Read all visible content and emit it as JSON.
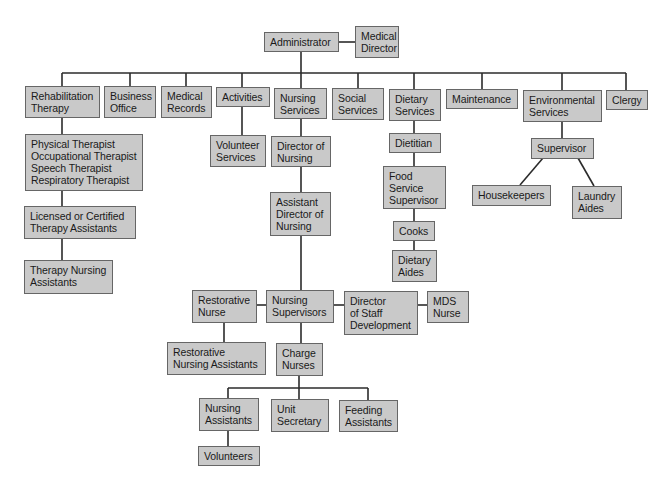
{
  "diagram": {
    "type": "org-chart",
    "colors": {
      "box_fill": "#c9c9c9",
      "box_border": "#666666",
      "line": "#2b2b2b",
      "text": "#1a1a1a",
      "background": "#ffffff"
    },
    "nodes": {
      "administrator": "Administrator",
      "medical_director": "Medical\nDirector",
      "rehabilitation_therapy": "Rehabilitation\nTherapy",
      "business_office": "Business\nOffice",
      "medical_records": "Medical\nRecords",
      "activities": "Activities",
      "nursing_services": "Nursing\nServices",
      "social_services": "Social\nServices",
      "dietary_services": "Dietary\nServices",
      "maintenance": "Maintenance",
      "environmental_services": "Environmental\nServices",
      "clergy": "Clergy",
      "therapists": "Physical Therapist\nOccupational Therapist\nSpeech Therapist\nRespiratory Therapist",
      "licensed_therapy_assistants": "Licensed or Certified\nTherapy Assistants",
      "therapy_nursing_assistants": "Therapy Nursing\nAssistants",
      "volunteer_services": "Volunteer\nServices",
      "director_of_nursing": "Director of\nNursing",
      "assistant_director_of_nursing": "Assistant\nDirector of\nNursing",
      "restorative_nurse": "Restorative\nNurse",
      "nursing_supervisors": "Nursing\nSupervisors",
      "director_staff_development": "Director\nof Staff\nDevelopment",
      "mds_nurse": "MDS\nNurse",
      "restorative_nursing_assistants": "Restorative\nNursing Assistants",
      "charge_nurses": "Charge\nNurses",
      "nursing_assistants": "Nursing\nAssistants",
      "unit_secretary": "Unit\nSecretary",
      "feeding_assistants": "Feeding\nAssistants",
      "volunteers": "Volunteers",
      "dietitian": "Dietitian",
      "food_service_supervisor": "Food\nService\nSupervisor",
      "cooks": "Cooks",
      "dietary_aides": "Dietary\nAides",
      "supervisor": "Supervisor",
      "housekeepers": "Housekeepers",
      "laundry_aides": "Laundry\nAides"
    },
    "edges": [
      [
        "administrator",
        "medical_director"
      ],
      [
        "administrator",
        "rehabilitation_therapy"
      ],
      [
        "administrator",
        "business_office"
      ],
      [
        "administrator",
        "medical_records"
      ],
      [
        "administrator",
        "activities"
      ],
      [
        "administrator",
        "nursing_services"
      ],
      [
        "administrator",
        "social_services"
      ],
      [
        "administrator",
        "dietary_services"
      ],
      [
        "administrator",
        "maintenance"
      ],
      [
        "administrator",
        "environmental_services"
      ],
      [
        "administrator",
        "clergy"
      ],
      [
        "rehabilitation_therapy",
        "therapists"
      ],
      [
        "therapists",
        "licensed_therapy_assistants"
      ],
      [
        "licensed_therapy_assistants",
        "therapy_nursing_assistants"
      ],
      [
        "activities",
        "volunteer_services"
      ],
      [
        "nursing_services",
        "director_of_nursing"
      ],
      [
        "director_of_nursing",
        "assistant_director_of_nursing"
      ],
      [
        "assistant_director_of_nursing",
        "nursing_supervisors"
      ],
      [
        "nursing_supervisors",
        "restorative_nurse"
      ],
      [
        "nursing_supervisors",
        "director_staff_development"
      ],
      [
        "director_staff_development",
        "mds_nurse"
      ],
      [
        "restorative_nurse",
        "restorative_nursing_assistants"
      ],
      [
        "nursing_supervisors",
        "charge_nurses"
      ],
      [
        "charge_nurses",
        "nursing_assistants"
      ],
      [
        "charge_nurses",
        "unit_secretary"
      ],
      [
        "charge_nurses",
        "feeding_assistants"
      ],
      [
        "nursing_assistants",
        "volunteers"
      ],
      [
        "dietary_services",
        "dietitian"
      ],
      [
        "dietitian",
        "food_service_supervisor"
      ],
      [
        "food_service_supervisor",
        "cooks"
      ],
      [
        "cooks",
        "dietary_aides"
      ],
      [
        "environmental_services",
        "supervisor"
      ],
      [
        "supervisor",
        "housekeepers"
      ],
      [
        "supervisor",
        "laundry_aides"
      ]
    ]
  }
}
